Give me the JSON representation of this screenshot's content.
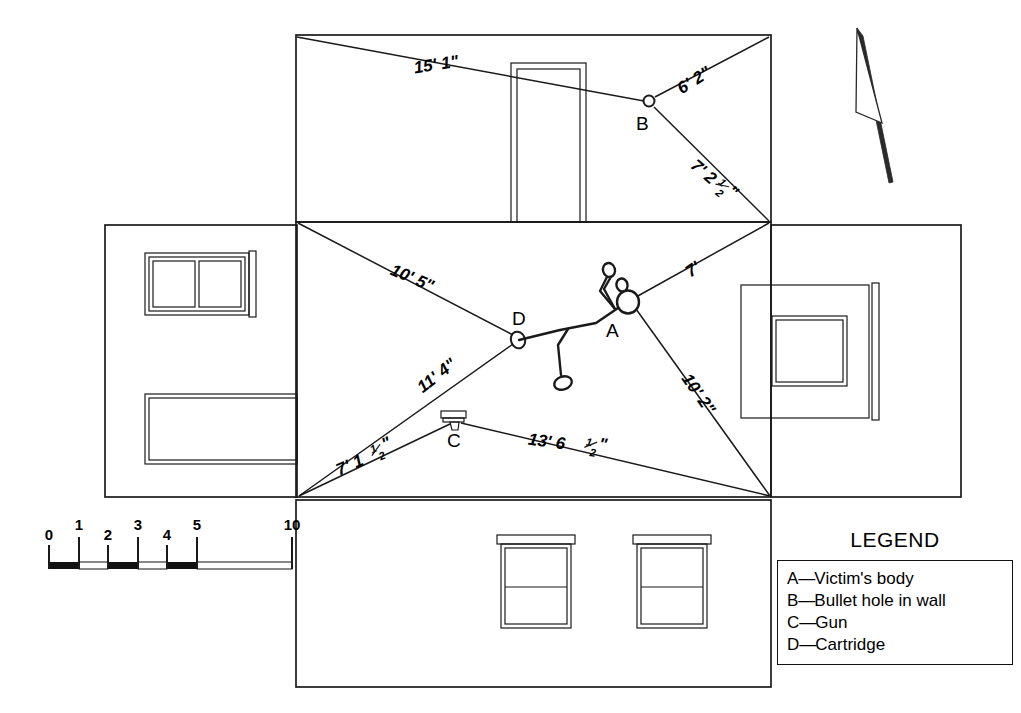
{
  "document": {
    "type": "crime-scene-sketch",
    "description": "Exploded-view crime scene sketch with measurements"
  },
  "north_arrow": {
    "name": "north-arrow",
    "direction": "up-left"
  },
  "markers": [
    {
      "id": "A",
      "label": "A",
      "x": 628,
      "y": 302,
      "meaning": "Victim's body"
    },
    {
      "id": "B",
      "label": "B",
      "x": 649,
      "y": 101,
      "meaning": "Bullet hole in wall"
    },
    {
      "id": "C",
      "label": "C",
      "x": 455,
      "y": 420,
      "meaning": "Gun"
    },
    {
      "id": "D",
      "label": "D",
      "x": 518,
      "y": 338,
      "meaning": "Cartridge"
    }
  ],
  "measurements": [
    {
      "id": "m1",
      "value": "15' 1\"",
      "from": "top-left-corner",
      "to": "B",
      "x": 437,
      "y": 70,
      "rotate": -9
    },
    {
      "id": "m2",
      "value": "6' 2\"",
      "from": "top-right-corner",
      "to": "B",
      "x": 697,
      "y": 83,
      "rotate": -30
    },
    {
      "id": "m3",
      "value": "7' 2",
      "value_frac": "1/2",
      "value_suffix": "\"",
      "from": "right-corner",
      "to": "B",
      "x": 700,
      "y": 176,
      "rotate": 41
    },
    {
      "id": "m4",
      "value": "10' 5\"",
      "from": "left-top-corner",
      "to": "D",
      "x": 408,
      "y": 282,
      "rotate": 24
    },
    {
      "id": "m5",
      "value": "11' 4\"",
      "from": "left-bottom-corner",
      "to": "D",
      "x": 437,
      "y": 381,
      "rotate": -40
    },
    {
      "id": "m6",
      "value": "7'",
      "from": "right-top-corner",
      "to": "A",
      "x": 694,
      "y": 273,
      "rotate": -35
    },
    {
      "id": "m7",
      "value": "10' 2\"",
      "from": "right-bottom-corner",
      "to": "A",
      "x": 694,
      "y": 396,
      "rotate": 55
    },
    {
      "id": "m8",
      "value": "7' 1",
      "value_frac": "1/2",
      "value_suffix": "\"",
      "from": "left-bottom-corner",
      "to": "C",
      "x": 352,
      "y": 470,
      "rotate": -24
    },
    {
      "id": "m9",
      "value": "13' 6 ",
      "value_frac": "1/2",
      "value_suffix": "\"",
      "from": "right-bottom-corner",
      "to": "C",
      "x": 546,
      "y": 447,
      "rotate": 8
    }
  ],
  "measurement_text": {
    "m1": "15' 1\"",
    "m2": "6' 2\"",
    "m3_int": "7' 2",
    "m3_num": "1",
    "m3_den": "2",
    "m3_unit": "\"",
    "m4": "10' 5\"",
    "m5": "11' 4\"",
    "m6": "7'",
    "m7": "10' 2\"",
    "m8_int": "7' 1",
    "m8_num": "1",
    "m8_den": "2",
    "m8_unit": "\"",
    "m9_int": "13' 6",
    "m9_num": "1",
    "m9_den": "2",
    "m9_unit": "\""
  },
  "scale_bar": {
    "name": "scale-bar",
    "ticks": [
      "0",
      "1",
      "2",
      "3",
      "4",
      "5",
      "10"
    ],
    "tick_values": [
      0,
      1,
      2,
      3,
      4,
      5,
      10
    ],
    "unit": "feet"
  },
  "legend": {
    "title": "LEGEND",
    "entries": [
      {
        "key": "A",
        "dash": "—",
        "text": "Victim's body"
      },
      {
        "key": "B",
        "dash": "—",
        "text": "Bullet hole in wall"
      },
      {
        "key": "C",
        "dash": "—",
        "text": "Gun"
      },
      {
        "key": "D",
        "dash": "—",
        "text": "Cartridge"
      }
    ]
  },
  "rooms": {
    "top_wall": {
      "name": "top-wall-panel",
      "features": [
        "door"
      ]
    },
    "left_wall": {
      "name": "left-wall-panel",
      "features": [
        "window",
        "long-opening"
      ]
    },
    "center_floor": {
      "name": "center-floor-plan",
      "features": [
        "body",
        "gun",
        "cartridge"
      ]
    },
    "right_wall": {
      "name": "right-wall-panel",
      "features": [
        "window"
      ]
    },
    "bottom_wall": {
      "name": "bottom-wall-panel",
      "features": [
        "window",
        "window"
      ]
    }
  },
  "colors": {
    "ink": "#1a1a1a",
    "paper": "#ffffff"
  }
}
